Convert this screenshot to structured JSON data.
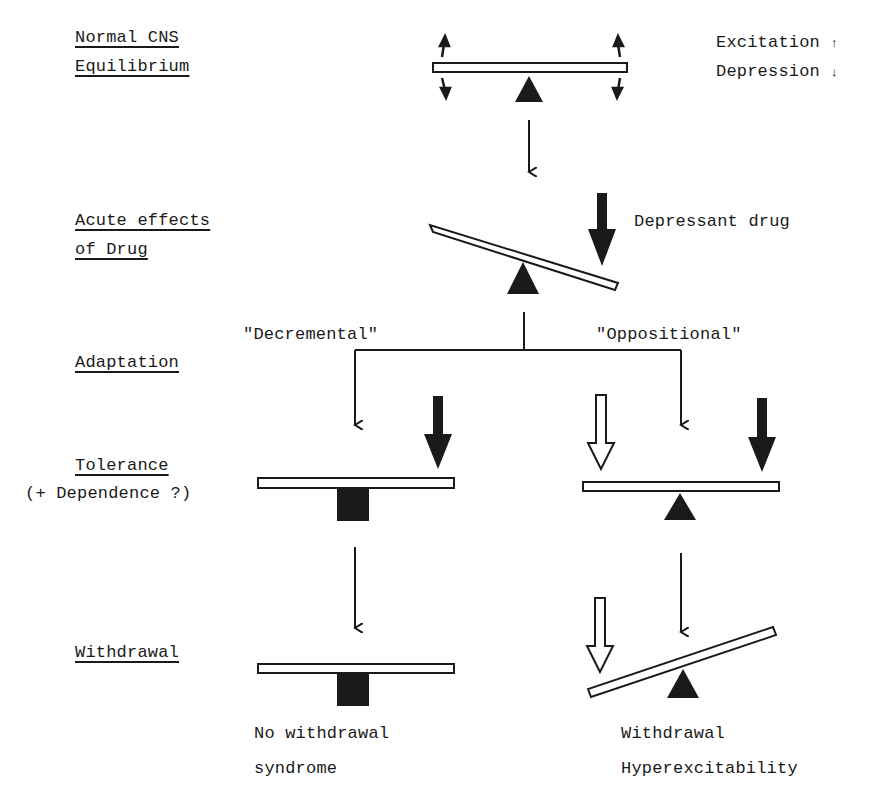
{
  "stages": {
    "normal_line1": "Normal CNS",
    "normal_line2": "Equilibrium",
    "acute_line1": "Acute effects",
    "acute_line2": "of Drug",
    "adaptation": "Adaptation",
    "tolerance": "Tolerance",
    "dependence": "(+ Dependence ?)",
    "withdrawal": "Withdrawal"
  },
  "legend": {
    "excitation": "Excitation",
    "excitation_symbol": "↑",
    "depression": "Depression",
    "depression_symbol": "↓"
  },
  "annotations": {
    "drug": "Depressant drug",
    "decremental": "\"Decremental\"",
    "oppositional": "\"Oppositional\""
  },
  "outcomes": {
    "left_line1": "No withdrawal",
    "left_line2": "syndrome",
    "right_line1": "Withdrawal",
    "right_line2": "Hyperexcitability"
  },
  "colors": {
    "ink": "#1a1a1a",
    "paper": "#ffffff"
  }
}
